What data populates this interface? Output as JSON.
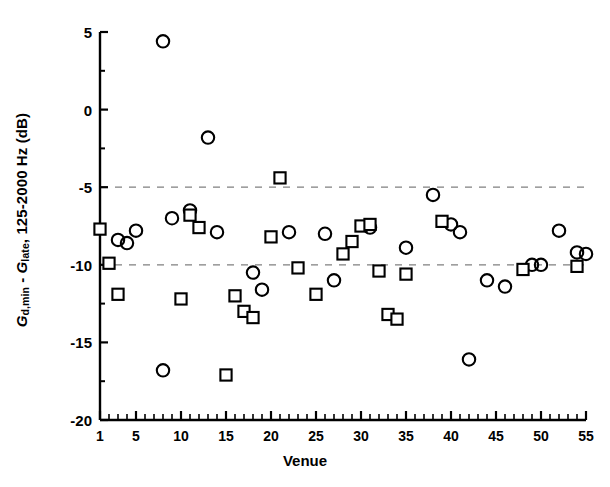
{
  "chart_data": {
    "type": "scatter",
    "title": "",
    "xlabel": "Venue",
    "ylabel": "G_d,min - G_late, 125-2000 Hz (dB)",
    "ylabel_parts": {
      "sym1": "G",
      "sub1": "d,min",
      "minus": " - ",
      "sym2": "G",
      "sub2": "late",
      "tail": ", 125-2000 Hz (dB)"
    },
    "xlim": [
      1,
      55
    ],
    "ylim": [
      -20,
      5
    ],
    "grid": false,
    "legend": null,
    "xticks_major": [
      1,
      5,
      10,
      15,
      20,
      25,
      30,
      35,
      40,
      45,
      50,
      55
    ],
    "xticklabels": [
      "1",
      "5",
      "10",
      "15",
      "20",
      "25",
      "30",
      "35",
      "40",
      "45",
      "50",
      "55"
    ],
    "xticks_minor_step": 1,
    "yticks_major": [
      5,
      0,
      -5,
      -10,
      -15,
      -20
    ],
    "yticklabels": [
      "5",
      "0",
      "-5",
      "-10",
      "-15",
      "-20"
    ],
    "yticks_minor": [
      2.5,
      -2.5,
      -7.5,
      -12.5,
      -17.5
    ],
    "reference_lines": [
      {
        "name": "upper-dashed-line",
        "y": -5,
        "style": "dashed",
        "color": "#808080"
      },
      {
        "name": "lower-dashed-line",
        "y": -10,
        "style": "dashed",
        "color": "#808080"
      }
    ],
    "series": [
      {
        "name": "circles",
        "marker": "circle",
        "color": "#000000",
        "fill": "none",
        "points": [
          {
            "x": 3,
            "y": -8.4
          },
          {
            "x": 4,
            "y": -8.6
          },
          {
            "x": 5,
            "y": -7.8
          },
          {
            "x": 8,
            "y": 4.4
          },
          {
            "x": 8,
            "y": -16.8
          },
          {
            "x": 9,
            "y": -7.0
          },
          {
            "x": 11,
            "y": -6.5
          },
          {
            "x": 13,
            "y": -1.8
          },
          {
            "x": 14,
            "y": -7.9
          },
          {
            "x": 18,
            "y": -10.5
          },
          {
            "x": 19,
            "y": -11.6
          },
          {
            "x": 22,
            "y": -7.9
          },
          {
            "x": 26,
            "y": -8.0
          },
          {
            "x": 27,
            "y": -11.0
          },
          {
            "x": 31,
            "y": -7.6
          },
          {
            "x": 35,
            "y": -8.9
          },
          {
            "x": 38,
            "y": -5.5
          },
          {
            "x": 40,
            "y": -7.4
          },
          {
            "x": 41,
            "y": -7.9
          },
          {
            "x": 42,
            "y": -16.1
          },
          {
            "x": 44,
            "y": -11.0
          },
          {
            "x": 46,
            "y": -11.4
          },
          {
            "x": 49,
            "y": -10.0
          },
          {
            "x": 50,
            "y": -10.0
          },
          {
            "x": 52,
            "y": -7.8
          },
          {
            "x": 54,
            "y": -9.2
          },
          {
            "x": 55,
            "y": -9.3
          }
        ]
      },
      {
        "name": "squares",
        "marker": "square",
        "color": "#000000",
        "fill": "none",
        "points": [
          {
            "x": 1,
            "y": -7.7
          },
          {
            "x": 2,
            "y": -9.9
          },
          {
            "x": 3,
            "y": -11.9
          },
          {
            "x": 10,
            "y": -12.2
          },
          {
            "x": 11,
            "y": -6.8
          },
          {
            "x": 12,
            "y": -7.6
          },
          {
            "x": 15,
            "y": -17.1
          },
          {
            "x": 16,
            "y": -12.0
          },
          {
            "x": 17,
            "y": -13.0
          },
          {
            "x": 18,
            "y": -13.4
          },
          {
            "x": 20,
            "y": -8.2
          },
          {
            "x": 21,
            "y": -4.4
          },
          {
            "x": 23,
            "y": -10.2
          },
          {
            "x": 25,
            "y": -11.9
          },
          {
            "x": 28,
            "y": -9.3
          },
          {
            "x": 29,
            "y": -8.5
          },
          {
            "x": 30,
            "y": -7.5
          },
          {
            "x": 31,
            "y": -7.4
          },
          {
            "x": 32,
            "y": -10.4
          },
          {
            "x": 33,
            "y": -13.2
          },
          {
            "x": 34,
            "y": -13.5
          },
          {
            "x": 35,
            "y": -10.6
          },
          {
            "x": 39,
            "y": -7.2
          },
          {
            "x": 48,
            "y": -10.3
          },
          {
            "x": 54,
            "y": -10.1
          }
        ]
      }
    ]
  },
  "axes": {
    "left_label": "y-axis",
    "bottom_label": "x-axis"
  }
}
